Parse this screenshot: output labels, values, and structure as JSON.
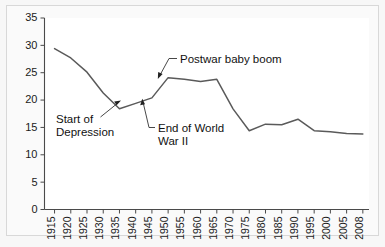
{
  "figure": {
    "background_color": "#f7f7f7",
    "plot_background_color": "#ffffff",
    "line_color": "#5a5a5a",
    "text_color": "#1a1a1a"
  },
  "chart_data": {
    "type": "line",
    "title": "",
    "subtitle": "",
    "xlabel": "",
    "ylabel": "",
    "grid": false,
    "legend": "none",
    "xlim": [
      1915,
      2008
    ],
    "ylim": [
      0,
      35
    ],
    "ytick_labels": [
      "0",
      "5",
      "10",
      "15",
      "20",
      "25",
      "30",
      "35"
    ],
    "ytick_values": [
      0,
      5,
      10,
      15,
      20,
      25,
      30,
      35
    ],
    "xtick_labels": [
      "1915",
      "1920",
      "1925",
      "1930",
      "1935",
      "1940",
      "1945",
      "1950",
      "1955",
      "1960",
      "1965",
      "1970",
      "1975",
      "1980",
      "1985",
      "1990",
      "1995",
      "2000",
      "2005",
      "2008"
    ],
    "x": [
      1915,
      1920,
      1925,
      1930,
      1935,
      1940,
      1945,
      1950,
      1955,
      1960,
      1965,
      1970,
      1975,
      1980,
      1985,
      1990,
      1995,
      2000,
      2005,
      2008
    ],
    "values": [
      29.4,
      27.7,
      25.1,
      21.3,
      18.4,
      19.4,
      20.4,
      24.1,
      23.8,
      23.4,
      23.8,
      18.4,
      14.4,
      15.6,
      15.5,
      16.5,
      14.4,
      14.2,
      13.9,
      13.8
    ],
    "series": [
      {
        "name": "Birth rate",
        "values": [
          29.4,
          27.7,
          25.1,
          21.3,
          18.4,
          19.4,
          20.4,
          24.1,
          23.8,
          23.4,
          23.8,
          18.4,
          14.4,
          15.6,
          15.5,
          16.5,
          14.4,
          14.2,
          13.9,
          13.8
        ]
      }
    ],
    "annotations": [
      {
        "id": "start-of-depression",
        "line1": "Start of",
        "line2": "Depression",
        "target_x": 1935,
        "target_y": 18.4
      },
      {
        "id": "postwar-baby-boom",
        "line1": "Postwar baby boom",
        "line2": "",
        "target_x": 1950,
        "target_y": 24.1
      },
      {
        "id": "end-of-world-war-ii",
        "line1": "End of World",
        "line2": "War II",
        "target_x": 1945,
        "target_y": 20.4
      }
    ]
  }
}
